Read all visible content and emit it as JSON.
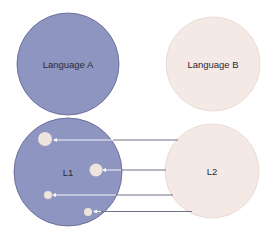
{
  "diagram": {
    "colors": {
      "language_a_fill": "#8e95c0",
      "language_a_stroke": "#5c6290",
      "language_b_fill": "#f5e9e5",
      "language_b_stroke": "#e6d5cf",
      "dot_fill": "#efe4dc",
      "line_color": "#6e7388",
      "arrow_color": "#ffffff"
    },
    "nodes": [
      {
        "id": "language-a",
        "label": "Language A"
      },
      {
        "id": "language-b",
        "label": "Language B"
      },
      {
        "id": "l1",
        "label": "L1"
      },
      {
        "id": "l2",
        "label": "L2"
      }
    ],
    "connections": [
      {
        "from": "l2",
        "to": "l1-dot-1"
      },
      {
        "from": "l2",
        "to": "l1-dot-2"
      },
      {
        "from": "l2",
        "to": "l1-dot-3"
      },
      {
        "from": "l2",
        "to": "l1-dot-4"
      }
    ]
  }
}
